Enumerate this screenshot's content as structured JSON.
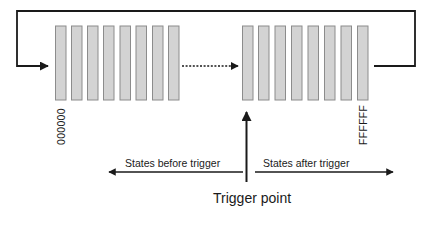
{
  "diagram": {
    "type": "circular trigger buffer",
    "colors": {
      "line": "#1a1a1a",
      "cell_fill": "#d3d3d3",
      "cell_stroke": "#8c8c8c",
      "background": "#ffffff"
    },
    "buffer": {
      "left_group_cells": 8,
      "right_group_cells": 8,
      "gap_connector": "dotted-arrow"
    },
    "labels": {
      "start_address": "000000",
      "end_address": "FFFFFF",
      "before": "States before trigger",
      "after": "States after trigger",
      "trigger": "Trigger point"
    }
  }
}
